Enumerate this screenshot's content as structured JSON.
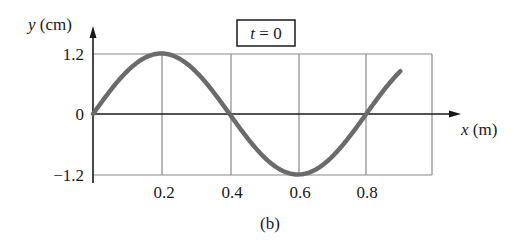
{
  "chart_data": {
    "type": "line",
    "title": "t = 0",
    "caption": "(b)",
    "xlabel": "x (m)",
    "ylabel": "y (cm)",
    "x_ticks": [
      "0.2",
      "0.4",
      "0.6",
      "0.8"
    ],
    "y_ticks": [
      "1.2",
      "0",
      "−1.2"
    ],
    "xlim": [
      0,
      1.0
    ],
    "ylim": [
      -1.2,
      1.2
    ],
    "grid": true,
    "legend": null,
    "series": [
      {
        "name": "y(x, t=0)",
        "function": "1.2 * sin(2*pi*x/0.8)",
        "amplitude_cm": 1.2,
        "wavelength_m": 0.8,
        "x": [
          0,
          0.1,
          0.2,
          0.3,
          0.4,
          0.5,
          0.6,
          0.7,
          0.8,
          0.9
        ],
        "y": [
          0,
          0.85,
          1.2,
          0.85,
          0,
          -0.85,
          -1.2,
          -0.85,
          0,
          0.85
        ],
        "color": "#6b6b6b"
      }
    ]
  },
  "labels": {
    "y_axis_var": "y",
    "y_axis_unit": " (cm)",
    "x_axis_var": "x",
    "x_axis_unit": " (m)",
    "time_var": "t",
    "time_eq": " = 0",
    "caption": "(b)"
  }
}
